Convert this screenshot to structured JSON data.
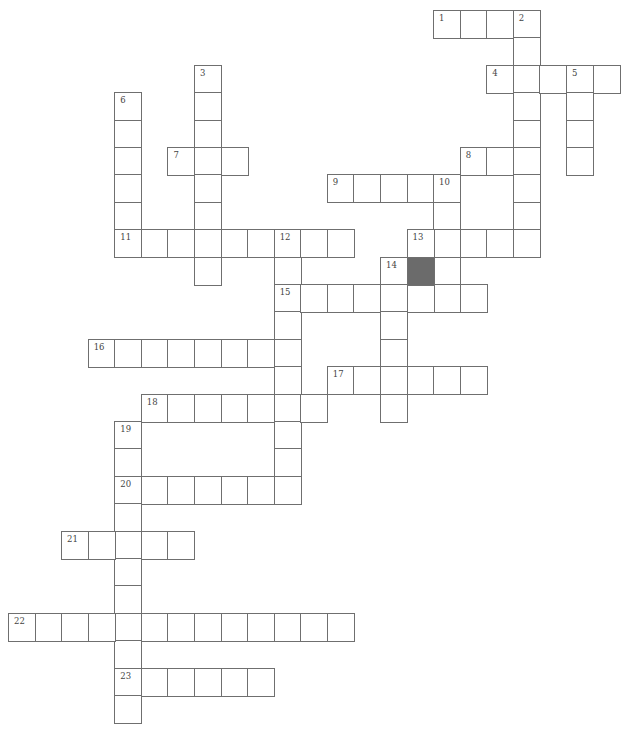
{
  "puzzle": {
    "title": "Crossword",
    "grid_cols": 23,
    "grid_rows": 26,
    "colors": {
      "cell_border": "#6f6f6f",
      "cell_fill": "#ffffff",
      "blocked_fill": "#6b6b6b",
      "number_text": "#444444"
    },
    "words": [
      {
        "number": "1",
        "direction": "across",
        "row": 0,
        "col": 16,
        "length": 4
      },
      {
        "number": "2",
        "direction": "down",
        "row": 0,
        "col": 19,
        "length": 9
      },
      {
        "number": "3",
        "direction": "down",
        "row": 2,
        "col": 7,
        "length": 8
      },
      {
        "number": "4",
        "direction": "across",
        "row": 2,
        "col": 18,
        "length": 5
      },
      {
        "number": "5",
        "direction": "down",
        "row": 2,
        "col": 21,
        "length": 4
      },
      {
        "number": "6",
        "direction": "down",
        "row": 3,
        "col": 4,
        "length": 6
      },
      {
        "number": "7",
        "direction": "across",
        "row": 5,
        "col": 6,
        "length": 3
      },
      {
        "number": "8",
        "direction": "across",
        "row": 5,
        "col": 17,
        "length": 3
      },
      {
        "number": "9",
        "direction": "across",
        "row": 6,
        "col": 12,
        "length": 5
      },
      {
        "number": "10",
        "direction": "down",
        "row": 6,
        "col": 16,
        "length": 5
      },
      {
        "number": "11",
        "direction": "across",
        "row": 8,
        "col": 4,
        "length": 9
      },
      {
        "number": "12",
        "direction": "down",
        "row": 8,
        "col": 10,
        "length": 10
      },
      {
        "number": "13",
        "direction": "across",
        "row": 8,
        "col": 15,
        "length": 5
      },
      {
        "number": "14",
        "direction": "down",
        "row": 9,
        "col": 14,
        "length": 6
      },
      {
        "number": "15",
        "direction": "across",
        "row": 10,
        "col": 10,
        "length": 8
      },
      {
        "number": "16",
        "direction": "across",
        "row": 12,
        "col": 3,
        "length": 8
      },
      {
        "number": "17",
        "direction": "across",
        "row": 13,
        "col": 12,
        "length": 6
      },
      {
        "number": "18",
        "direction": "across",
        "row": 14,
        "col": 5,
        "length": 7
      },
      {
        "number": "19",
        "direction": "down",
        "row": 15,
        "col": 4,
        "length": 11
      },
      {
        "number": "20",
        "direction": "across",
        "row": 17,
        "col": 4,
        "length": 7
      },
      {
        "number": "21",
        "direction": "across",
        "row": 19,
        "col": 2,
        "length": 5
      },
      {
        "number": "22",
        "direction": "across",
        "row": 22,
        "col": 0,
        "length": 13
      },
      {
        "number": "23",
        "direction": "across",
        "row": 24,
        "col": 4,
        "length": 6
      }
    ],
    "blocked_cells": [
      {
        "row": 9,
        "col": 15
      }
    ]
  }
}
